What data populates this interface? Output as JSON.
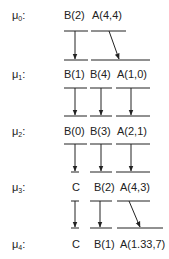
{
  "levels": [
    {
      "name": "μ",
      "sub": "0",
      "suffix": ":",
      "items": [
        "B(2)",
        "A(4,4)"
      ]
    },
    {
      "name": "μ",
      "sub": "1",
      "suffix": ":",
      "items": [
        "B(1)",
        "B(4)",
        "A(1,0)"
      ]
    },
    {
      "name": "μ",
      "sub": "2",
      "suffix": ":",
      "items": [
        "B(0)",
        "B(3)",
        "A(2,1)"
      ]
    },
    {
      "name": "μ",
      "sub": "3",
      "suffix": ":",
      "items": [
        "C",
        "B(2)",
        "A(4,3)"
      ]
    },
    {
      "name": "μ",
      "sub": "4",
      "suffix": ":",
      "items": [
        "C",
        "B(1)",
        "A(1.33,7)"
      ]
    }
  ],
  "colors": {
    "ink": "#222222",
    "background": "#ffffff"
  }
}
